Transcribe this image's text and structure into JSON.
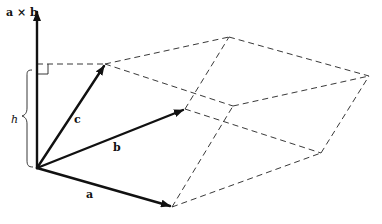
{
  "figure": {
    "labels": {
      "axis": "a × b",
      "a": "a",
      "b": "b",
      "c": "c",
      "height": "h"
    },
    "points": {
      "origin": [
        37,
        168
      ],
      "axis_top": [
        37,
        10
      ],
      "a_tip": [
        172,
        207
      ],
      "b_tip": [
        185,
        109
      ],
      "c_tip": [
        105,
        64
      ],
      "b_plus_c": [
        229,
        37
      ],
      "a_plus_c": [
        233,
        106
      ],
      "a_plus_b": [
        321,
        153
      ],
      "a_plus_b_plus_c": [
        369,
        76
      ],
      "foot_on_axis": [
        37,
        64
      ]
    },
    "colors": {
      "ink": "#111111",
      "background": "#ffffff"
    }
  }
}
